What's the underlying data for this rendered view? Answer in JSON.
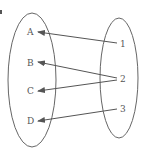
{
  "diagram": {
    "type": "mapping",
    "domain": {
      "elements": [
        "A",
        "B",
        "C",
        "D"
      ]
    },
    "codomain": {
      "elements": [
        "1",
        "2",
        "3"
      ]
    },
    "arrows": [
      {
        "from": "1",
        "to": "A"
      },
      {
        "from": "2",
        "to": "B"
      },
      {
        "from": "2",
        "to": "C"
      },
      {
        "from": "3",
        "to": "D"
      }
    ],
    "colors": {
      "stroke": "#555555",
      "background": "#ffffff"
    }
  }
}
